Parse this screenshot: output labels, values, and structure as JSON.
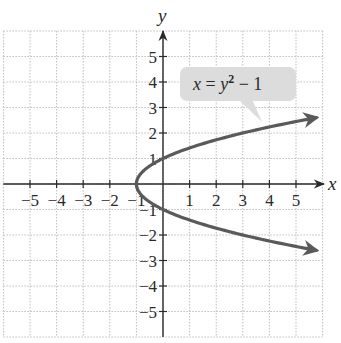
{
  "chart_data": {
    "type": "line",
    "title": "",
    "xlabel": "x",
    "ylabel": "y",
    "xlim": [
      -6,
      6
    ],
    "ylim": [
      -6,
      6
    ],
    "grid": true,
    "x_ticks": [
      -5,
      -4,
      -3,
      -2,
      -1,
      1,
      2,
      3,
      4,
      5
    ],
    "y_ticks": [
      -5,
      -4,
      -3,
      -2,
      -1,
      1,
      2,
      3,
      4,
      5
    ],
    "x_tick_labels": [
      "−5",
      "−4",
      "−3",
      "−2",
      "−1",
      "1",
      "2",
      "3",
      "4",
      "5"
    ],
    "y_tick_labels": [
      "−5",
      "−4",
      "−3",
      "−2",
      "−1",
      "1",
      "2",
      "3",
      "4",
      "5"
    ],
    "series": [
      {
        "name": "x = y² − 1",
        "equation": "x = y^2 - 1",
        "color": "#5a5a5a",
        "y_range": [
          -2.6,
          2.6
        ],
        "points": [
          {
            "x": 5.76,
            "y": -2.6
          },
          {
            "x": 3,
            "y": -2
          },
          {
            "x": 0,
            "y": -1
          },
          {
            "x": -1,
            "y": 0
          },
          {
            "x": 0,
            "y": 1
          },
          {
            "x": 3,
            "y": 2
          },
          {
            "x": 5.76,
            "y": 2.6
          }
        ],
        "arrows_at_ends": true
      }
    ],
    "annotations": [
      {
        "text_parts": {
          "lhs": "x",
          "eq": " = ",
          "base": "y",
          "exp": "2",
          "rest": " − 1"
        },
        "points_to": {
          "x": 3.6,
          "y": 2.4
        },
        "style": "callout"
      }
    ]
  },
  "colors": {
    "grid": "#bdbdbd",
    "axis": "#2a2a2a",
    "curve": "#5a5a5a",
    "callout_bg": "#dcdcdc"
  }
}
